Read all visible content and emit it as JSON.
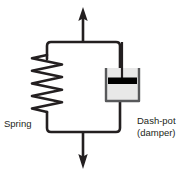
{
  "diagram": {
    "labels": {
      "spring": "Spring",
      "dashpot_line1": "Dash-pot",
      "dashpot_line2": "(damper)"
    },
    "colors": {
      "stroke": "#231f20",
      "text": "#231f20",
      "background": "#ffffff",
      "cup_fill": "#e8e8e8",
      "piston_fill": "#000000",
      "cup_edge": "#58595b"
    },
    "elements": {
      "spring_icon": "spring-coil",
      "dashpot_icon": "dashpot-cup",
      "piston_icon": "piston-bar",
      "arrow_top_icon": "arrow-up",
      "arrow_bottom_icon": "arrow-down"
    },
    "geometry": {
      "frame_left_x": 47,
      "frame_right_x": 120,
      "frame_top_y": 42,
      "frame_bottom_y": 132,
      "center_x": 83,
      "arrow_top_tip_y": 8,
      "arrow_bottom_tip_y": 168,
      "spring_top_y": 55,
      "spring_bottom_y": 112,
      "spring_coil_count": 9,
      "spring_amplitude": 15,
      "cup_left_x": 106,
      "cup_right_x": 139,
      "cup_top_y": 68,
      "cup_bottom_y": 101,
      "piston_y": 81,
      "piston_rod_x": 122
    }
  }
}
